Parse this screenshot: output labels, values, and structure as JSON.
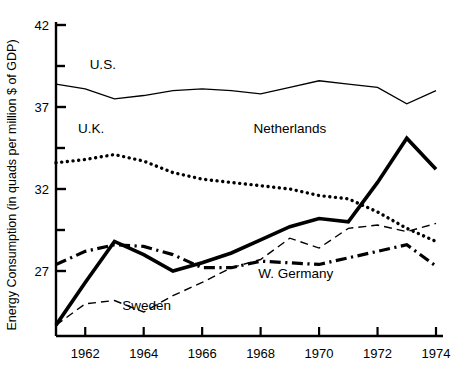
{
  "chart_data": {
    "type": "line",
    "title": "",
    "subtitle": "",
    "xlabel": "",
    "ylabel": "Energy Consumption (in quads per million $ of GDP)",
    "x": [
      1961,
      1962,
      1963,
      1964,
      1965,
      1966,
      1967,
      1968,
      1969,
      1970,
      1971,
      1972,
      1973,
      1974
    ],
    "xlim": [
      1961,
      1974
    ],
    "ylim": [
      23,
      42
    ],
    "grid": false,
    "legend_position": "inline-labels",
    "x_tick_labels": [
      "1962",
      "1964",
      "1966",
      "1968",
      "1970",
      "1972",
      "1974"
    ],
    "x_tick_values": [
      1962,
      1964,
      1966,
      1968,
      1970,
      1972,
      1974
    ],
    "y_tick_labels": [
      "42",
      "37",
      "32",
      "27"
    ],
    "y_tick_values": [
      42,
      37,
      32,
      27
    ],
    "y_minor_tick_values": [
      39.5,
      34.5,
      29.5
    ],
    "series": [
      {
        "name": "U.S.",
        "label": "U.S.",
        "style": "solid-thin",
        "color": "#000000",
        "label_x": 1962.6,
        "label_y": 39.3,
        "values": [
          38.4,
          38.1,
          37.5,
          37.7,
          38.0,
          38.1,
          38.0,
          37.8,
          38.2,
          38.6,
          38.4,
          38.2,
          37.2,
          38.0
        ]
      },
      {
        "name": "U.K.",
        "label": "U.K.",
        "style": "dotted",
        "color": "#000000",
        "label_x": 1962.2,
        "label_y": 35.4,
        "values": [
          33.6,
          33.8,
          34.1,
          33.7,
          33.0,
          32.6,
          32.4,
          32.2,
          32.0,
          31.6,
          31.4,
          30.6,
          29.6,
          28.8
        ]
      },
      {
        "name": "Netherlands",
        "label": "Netherlands",
        "style": "solid-thick",
        "color": "#000000",
        "label_x": 1969.0,
        "label_y": 35.4,
        "values": [
          23.7,
          26.3,
          28.8,
          28.0,
          27.0,
          27.5,
          28.1,
          28.9,
          29.7,
          30.2,
          30.0,
          32.4,
          35.1,
          33.2
        ]
      },
      {
        "name": "Sweden",
        "label": "Sweden",
        "style": "dashed-thin",
        "color": "#000000",
        "label_x": 1964.1,
        "label_y": 24.6,
        "values": [
          23.7,
          25.0,
          25.2,
          24.5,
          25.5,
          26.3,
          27.2,
          27.7,
          29.0,
          28.4,
          29.6,
          29.8,
          29.4,
          29.9
        ]
      },
      {
        "name": "W. Germany",
        "label": "W. Germany",
        "style": "dash-dot",
        "color": "#000000",
        "label_x": 1969.2,
        "label_y": 26.6,
        "values": [
          27.4,
          28.2,
          28.6,
          28.5,
          28.0,
          27.2,
          27.2,
          27.6,
          27.5,
          27.4,
          27.8,
          28.2,
          28.6,
          27.3
        ]
      }
    ]
  }
}
